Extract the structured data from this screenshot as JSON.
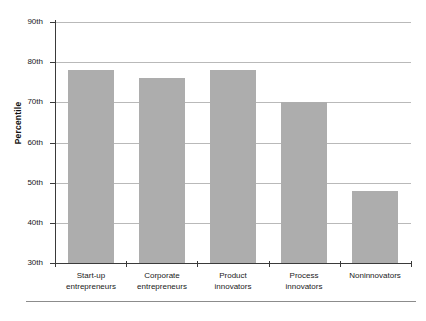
{
  "chart_data": {
    "type": "bar",
    "title": "",
    "subtitle": "",
    "xlabel": "",
    "ylabel": "Percentile",
    "categories": [
      "Start-up entrepreneurs",
      "Corporate entrepreneurs",
      "Product innovators",
      "Process innovators",
      "Noninnovators"
    ],
    "category_lines": [
      [
        "Start-up",
        "entrepreneurs"
      ],
      [
        "Corporate",
        "entrepreneurs"
      ],
      [
        "Product",
        "innovators"
      ],
      [
        "Process",
        "innovators"
      ],
      [
        "Noninnovators",
        ""
      ]
    ],
    "values": [
      78,
      76,
      78,
      70,
      48
    ],
    "ylim": [
      30,
      90
    ],
    "ytick_values": [
      30,
      40,
      50,
      60,
      70,
      80,
      90
    ],
    "ytick_labels": [
      "30th",
      "40th",
      "50th",
      "60th",
      "70th",
      "80th",
      "90th"
    ],
    "grid": true,
    "legend": null,
    "bar_color": "#adadad",
    "axis_color": "#3a3a3a",
    "grid_color": "#b9b9b9"
  }
}
